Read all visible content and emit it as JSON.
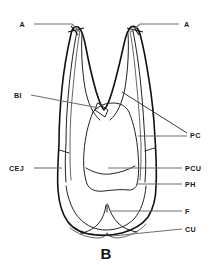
{
  "figure": {
    "caption": "B",
    "background_color": "#ffffff",
    "line_color": "#111111",
    "leader_color": "#6e6e6e"
  },
  "labels": {
    "apex_left": "A",
    "apex_right": "A",
    "bifurcation": "BI",
    "cemento_enamel_junction": "CEJ",
    "pulp_canal": "PC",
    "pulp_chamber_upper": "PCU",
    "pulp_horn": "PH",
    "fissure": "F",
    "cusp": "CU"
  }
}
